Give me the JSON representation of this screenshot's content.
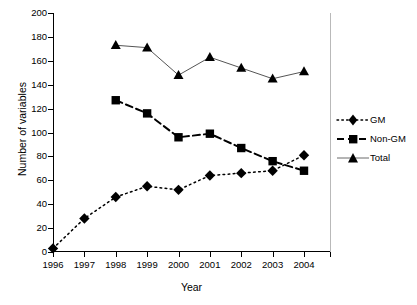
{
  "chart_data": {
    "type": "line",
    "title": "",
    "xlabel": "Year",
    "ylabel": "Number of variables",
    "categories": [
      "1996",
      "1997",
      "1998",
      "1999",
      "2000",
      "2001",
      "2002",
      "2003",
      "2004"
    ],
    "ylim": [
      0,
      200
    ],
    "yticks": [
      0,
      20,
      40,
      60,
      80,
      100,
      120,
      140,
      160,
      180,
      200
    ],
    "grid": "horizontal",
    "legend_position": "right",
    "series": [
      {
        "name": "GM",
        "marker": "diamond",
        "line_style": "dotted",
        "color": "#000000",
        "values": [
          3,
          28,
          46,
          55,
          52,
          64,
          66,
          68,
          81
        ]
      },
      {
        "name": "Non-GM",
        "marker": "square",
        "line_style": "dashed",
        "color": "#000000",
        "values": [
          null,
          null,
          127,
          116,
          96,
          99,
          87,
          76,
          68
        ]
      },
      {
        "name": "Total",
        "marker": "triangle",
        "line_style": "solid",
        "color": "#000000",
        "values": [
          null,
          null,
          173,
          171,
          148,
          163,
          154,
          145,
          151
        ]
      }
    ]
  },
  "legend": {
    "items": [
      {
        "label": "GM"
      },
      {
        "label": "Non-GM"
      },
      {
        "label": "Total"
      }
    ]
  }
}
